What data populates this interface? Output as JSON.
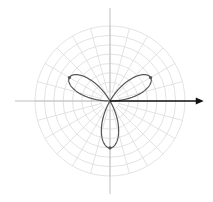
{
  "chart_data": {
    "type": "line",
    "subtype": "polar",
    "title": "",
    "equation": "r = 5 sin(3θ)",
    "curve": {
      "name": "three-petal rose",
      "amplitude": 5,
      "petals": 3,
      "petal_directions_deg": [
        30,
        150,
        270
      ],
      "petal_tips": [
        {
          "r": 5,
          "theta_deg": 30
        },
        {
          "r": 5,
          "theta_deg": 150
        },
        {
          "r": 5,
          "theta_deg": 270
        }
      ]
    },
    "vector": {
      "from": {
        "r": 0,
        "theta_deg": 0
      },
      "to": {
        "r": 10,
        "theta_deg": 0
      }
    },
    "grid": {
      "rings": 8,
      "r_max": 8,
      "radial_step_deg": 15,
      "on": true
    },
    "xlabel": "",
    "ylabel": "",
    "legend": []
  },
  "style": {
    "grid_color": "#dcdcdc",
    "axis_color": "#b8b8b8",
    "curve_color": "#555555",
    "vector_color": "#111111",
    "background": "#ffffff"
  }
}
